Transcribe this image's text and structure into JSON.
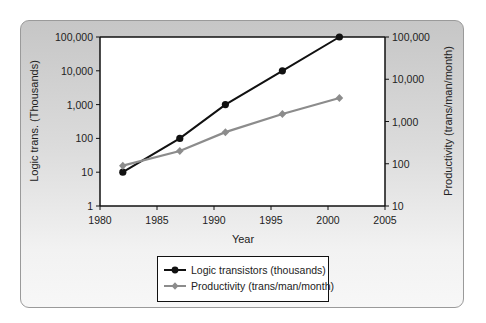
{
  "chart_data": {
    "type": "line",
    "title": "",
    "xlabel": "Year",
    "ylabel": "Logic trans. (Thousands)",
    "ylabel_right": "Productivity (trans/man/month)",
    "xlim": [
      1980,
      2005
    ],
    "ylim": [
      1,
      100000
    ],
    "ylim_right": [
      10,
      100000
    ],
    "yscale": "log",
    "yscale_right": "log",
    "grid": false,
    "legend_position": "bottom-center",
    "x_ticks": [
      "1980",
      "1985",
      "1990",
      "1995",
      "2000",
      "2005"
    ],
    "y_ticks": [
      "1",
      "10",
      "100",
      "1,000",
      "10,000",
      "100,000"
    ],
    "y_ticks_right": [
      "10",
      "100",
      "1,000",
      "10,000",
      "100,000"
    ],
    "x": [
      1982,
      1987,
      1991,
      1996,
      2001
    ],
    "series": [
      {
        "name": "Logic transistors (thousands)",
        "axis": "left",
        "color": "#111111",
        "marker": "circle",
        "values": [
          10,
          100,
          1000,
          10000,
          100000
        ]
      },
      {
        "name": "Productivity (trans/man/month)",
        "axis": "right",
        "color": "#8c8c8c",
        "marker": "diamond",
        "values": [
          90,
          200,
          560,
          1500,
          3600
        ]
      }
    ]
  },
  "labels": {
    "x_axis": "Year",
    "y_axis_left": "Logic trans. (Thousands)",
    "y_axis_right": "Productivity (trans/man/month)",
    "legend": [
      "Logic transistors (thousands)",
      "Productivity (trans/man/month)"
    ]
  }
}
